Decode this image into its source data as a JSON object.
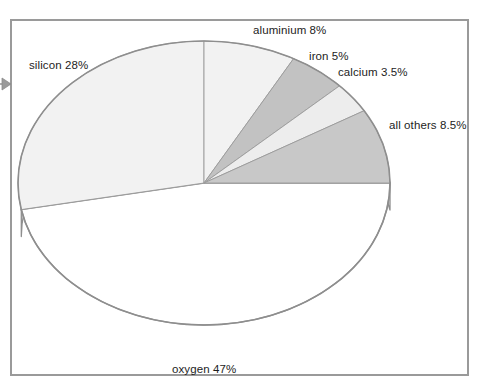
{
  "figure": {
    "kind": "pie-chart-3d",
    "frame_border_color": "#9a9a9a",
    "background_color": "#ffffff",
    "pointer_icon": "left-pointer-arrow-icon"
  },
  "chart_data": {
    "type": "pie",
    "title": "",
    "xlabel": "",
    "ylabel": "",
    "legend_position": "none",
    "labels_outside": true,
    "start_angle_deg": 90,
    "direction": "clockwise",
    "categories": [
      "aluminium",
      "iron",
      "calcium",
      "all others",
      "oxygen",
      "silicon"
    ],
    "values": [
      8,
      5,
      3.5,
      8.5,
      47,
      28
    ],
    "units": "%",
    "slices": [
      {
        "name": "aluminium",
        "value": 8,
        "label": "aluminium 8%",
        "color": "#f2f2f2"
      },
      {
        "name": "iron",
        "value": 5,
        "label": "iron 5%",
        "color": "#c2c2c2"
      },
      {
        "name": "calcium",
        "value": 3.5,
        "label": "calcium 3.5%",
        "color": "#ededed"
      },
      {
        "name": "all others",
        "value": 8.5,
        "label": "all others 8.5%",
        "color": "#c8c8c8"
      },
      {
        "name": "oxygen",
        "value": 47,
        "label": "oxygen 47%",
        "color": "#ffffff"
      },
      {
        "name": "silicon",
        "value": 28,
        "label": "silicon 28%",
        "color": "#f2f2f2"
      }
    ]
  },
  "labels": {
    "silicon": "silicon 28%",
    "aluminium": "aluminium 8%",
    "iron": "iron 5%",
    "calcium": "calcium 3.5%",
    "all_others": "all others 8.5%",
    "oxygen": "oxygen 47%"
  }
}
